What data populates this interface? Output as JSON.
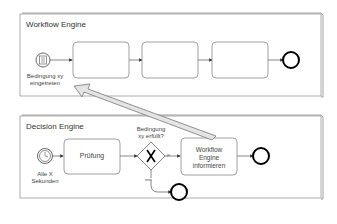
{
  "pools": [
    {
      "title": "Workflow Engine",
      "start_event": {
        "type": "conditional",
        "label_line1": "Bedingung xy",
        "label_line2": "eingetreten"
      }
    },
    {
      "title": "Decision Engine",
      "start_event": {
        "type": "timer",
        "label_line1": "Alle X",
        "label_line2": "Sekunden"
      },
      "task1": "Prüfung",
      "gateway": {
        "label_line1": "Bedingung",
        "label_line2": "xy erfüllt?",
        "yes": "ja",
        "no": "nein"
      },
      "task2": {
        "line1": "Workflow",
        "line2": "Engine",
        "line3": "informieren"
      }
    }
  ]
}
